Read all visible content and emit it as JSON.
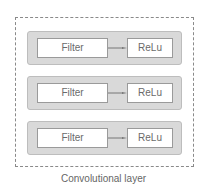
{
  "diagram": {
    "container_label": "Convolutional layer",
    "rows": [
      {
        "filter": "Filter",
        "activation": "ReLu"
      },
      {
        "filter": "Filter",
        "activation": "ReLu"
      },
      {
        "filter": "Filter",
        "activation": "ReLu"
      }
    ],
    "colors": {
      "panel": "#d9d9d9",
      "box": "#ffffff",
      "border": "#9a9a9a",
      "text": "#6a6a6a"
    }
  }
}
